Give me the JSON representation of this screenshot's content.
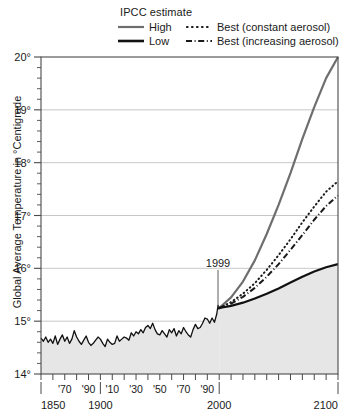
{
  "legend": {
    "title": "IPCC estimate",
    "entries": [
      {
        "label": "High",
        "style": "solid",
        "color": "#6e6e6e",
        "icon": "line-solid-gray-icon"
      },
      {
        "label": "Best (constant aerosol)",
        "style": "dotted",
        "color": "#1a1a1a",
        "icon": "line-dotted-icon"
      },
      {
        "label": "Low",
        "style": "solid",
        "color": "#111111",
        "icon": "line-solid-black-icon"
      },
      {
        "label": "Best (increasing aerosol)",
        "style": "dashdot",
        "color": "#1a1a1a",
        "icon": "line-dashdot-icon"
      }
    ]
  },
  "axes": {
    "y_title": "Global Average Temperature in °Centigrade",
    "y_ticks": [
      "14°",
      "15°",
      "16°",
      "17°",
      "18°",
      "19°",
      "20°"
    ],
    "y_min": 14,
    "y_max": 20,
    "x_min": 1850,
    "x_max": 2100,
    "x_major_labels": [
      "1850",
      "1900",
      "2000",
      "2100"
    ],
    "x_minor_labels": [
      "'70",
      "'90",
      "'10",
      "'30",
      "'50",
      "'70",
      "'90"
    ]
  },
  "annotation": {
    "label": "1999",
    "year": 1999
  },
  "chart_data": {
    "type": "line",
    "title": "",
    "xlabel": "",
    "ylabel": "Global Average Temperature in °Centigrade",
    "xlim": [
      1850,
      2100
    ],
    "ylim": [
      14,
      20
    ],
    "grid": "horizontal",
    "legend_position": "top",
    "annotations": [
      {
        "text": "1999",
        "x": 1999,
        "y": 15.95,
        "points_to_y": 15.25
      }
    ],
    "series": [
      {
        "name": "Observed",
        "style": "solid",
        "color": "#111111",
        "fill_below": "#e6e6e6",
        "x": [
          1850,
          1852,
          1854,
          1856,
          1858,
          1860,
          1862,
          1864,
          1866,
          1868,
          1870,
          1872,
          1874,
          1876,
          1878,
          1880,
          1882,
          1884,
          1886,
          1888,
          1890,
          1892,
          1894,
          1896,
          1898,
          1900,
          1902,
          1904,
          1906,
          1908,
          1910,
          1912,
          1914,
          1916,
          1918,
          1920,
          1922,
          1924,
          1926,
          1928,
          1930,
          1932,
          1934,
          1936,
          1938,
          1940,
          1942,
          1944,
          1946,
          1948,
          1950,
          1952,
          1954,
          1956,
          1958,
          1960,
          1962,
          1964,
          1966,
          1968,
          1970,
          1972,
          1974,
          1976,
          1978,
          1980,
          1982,
          1984,
          1986,
          1988,
          1990,
          1992,
          1994,
          1996,
          1998,
          1999,
          2000
        ],
        "y": [
          14.68,
          14.62,
          14.7,
          14.6,
          14.66,
          14.58,
          14.72,
          14.56,
          14.66,
          14.74,
          14.62,
          14.7,
          14.58,
          14.66,
          14.82,
          14.7,
          14.62,
          14.56,
          14.64,
          14.72,
          14.6,
          14.54,
          14.58,
          14.64,
          14.7,
          14.66,
          14.58,
          14.52,
          14.66,
          14.6,
          14.56,
          14.58,
          14.72,
          14.62,
          14.66,
          14.7,
          14.68,
          14.64,
          14.78,
          14.72,
          14.8,
          14.76,
          14.84,
          14.78,
          14.88,
          14.92,
          14.86,
          14.96,
          14.84,
          14.76,
          14.74,
          14.82,
          14.76,
          14.7,
          14.84,
          14.78,
          14.86,
          14.72,
          14.82,
          14.76,
          14.88,
          14.8,
          14.74,
          14.7,
          14.84,
          14.94,
          14.86,
          14.88,
          14.96,
          15.06,
          15.04,
          14.96,
          15.06,
          14.98,
          15.14,
          15.3,
          15.22
        ]
      },
      {
        "name": "High",
        "style": "solid",
        "color": "#6e6e6e",
        "x": [
          2000,
          2010,
          2020,
          2030,
          2040,
          2050,
          2060,
          2070,
          2080,
          2090,
          2100
        ],
        "y": [
          15.25,
          15.45,
          15.75,
          16.15,
          16.65,
          17.2,
          17.8,
          18.45,
          19.05,
          19.6,
          20.0
        ]
      },
      {
        "name": "Best (constant aerosol)",
        "style": "dotted",
        "color": "#1a1a1a",
        "x": [
          2000,
          2010,
          2020,
          2030,
          2040,
          2050,
          2060,
          2070,
          2080,
          2090,
          2100
        ],
        "y": [
          15.25,
          15.36,
          15.52,
          15.72,
          15.97,
          16.25,
          16.55,
          16.87,
          17.17,
          17.45,
          17.65
        ]
      },
      {
        "name": "Best (increasing aerosol)",
        "style": "dashdot",
        "color": "#1a1a1a",
        "x": [
          2000,
          2010,
          2020,
          2030,
          2040,
          2050,
          2060,
          2070,
          2080,
          2090,
          2100
        ],
        "y": [
          15.25,
          15.33,
          15.46,
          15.63,
          15.84,
          16.08,
          16.35,
          16.63,
          16.92,
          17.18,
          17.38
        ]
      },
      {
        "name": "Low",
        "style": "solid",
        "color": "#111111",
        "fill_below": "#e6e6e6",
        "x": [
          2000,
          2010,
          2020,
          2030,
          2040,
          2050,
          2060,
          2070,
          2080,
          2090,
          2100
        ],
        "y": [
          15.25,
          15.29,
          15.35,
          15.43,
          15.52,
          15.62,
          15.73,
          15.84,
          15.94,
          16.02,
          16.08
        ]
      }
    ]
  }
}
